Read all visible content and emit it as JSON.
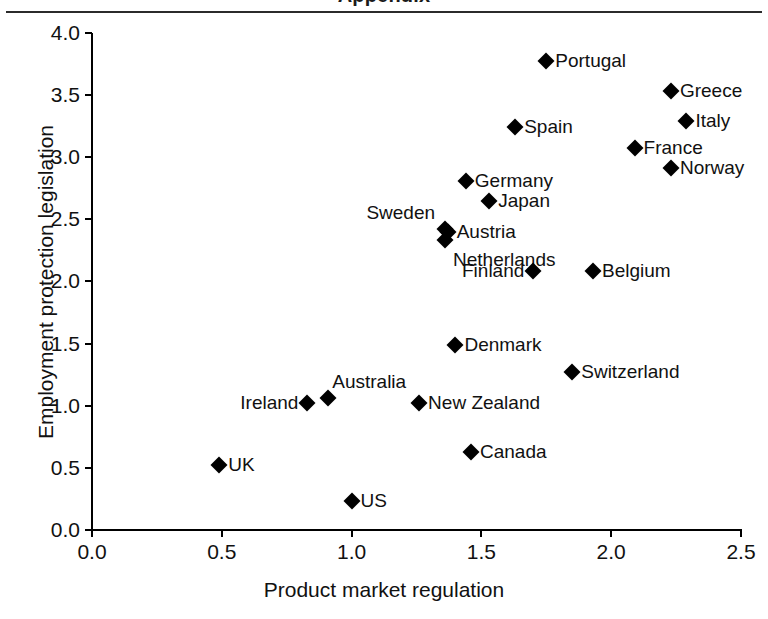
{
  "figure": {
    "title_remnant": "Appendix",
    "x_axis_title": "Product market regulation",
    "y_axis_title": "Employment protection legislation",
    "x_ticks": [
      "0.0",
      "0.5",
      "1.0",
      "1.5",
      "2.0",
      "2.5"
    ],
    "y_ticks": [
      "4.0",
      "3.5",
      "3.0",
      "2.5",
      "2.0",
      "1.5",
      "1.0",
      "0.5",
      "0.0"
    ],
    "marker_color": "#000000",
    "axis_color": "#000000"
  },
  "chart_data": {
    "type": "scatter",
    "title": "",
    "xlabel": "Product market regulation",
    "ylabel": "Employment protection legislation",
    "xlim": [
      0.0,
      2.5
    ],
    "ylim": [
      0.0,
      4.0
    ],
    "xticks": [
      0.0,
      0.5,
      1.0,
      1.5,
      2.0,
      2.5
    ],
    "yticks": [
      0.0,
      0.5,
      1.0,
      1.5,
      2.0,
      2.5,
      3.0,
      3.5,
      4.0
    ],
    "grid": false,
    "legend": "none",
    "marker": "diamond",
    "points": [
      {
        "label": "Portugal",
        "x": 1.75,
        "y": 3.77,
        "label_pos": "right"
      },
      {
        "label": "Greece",
        "x": 2.23,
        "y": 3.53,
        "label_pos": "right"
      },
      {
        "label": "Italy",
        "x": 2.29,
        "y": 3.29,
        "label_pos": "right"
      },
      {
        "label": "Spain",
        "x": 1.63,
        "y": 3.24,
        "label_pos": "right"
      },
      {
        "label": "France",
        "x": 2.09,
        "y": 3.07,
        "label_pos": "right"
      },
      {
        "label": "Norway",
        "x": 2.23,
        "y": 2.91,
        "label_pos": "right"
      },
      {
        "label": "Germany",
        "x": 1.44,
        "y": 2.81,
        "label_pos": "right"
      },
      {
        "label": "Japan",
        "x": 1.53,
        "y": 2.65,
        "label_pos": "right"
      },
      {
        "label": "Sweden",
        "x": 1.36,
        "y": 2.42,
        "label_pos": "left-above"
      },
      {
        "label": "Austria",
        "x": 1.37,
        "y": 2.4,
        "label_pos": "right"
      },
      {
        "label": "Netherlands",
        "x": 1.36,
        "y": 2.33,
        "label_pos": "right-below"
      },
      {
        "label": "Finland",
        "x": 1.7,
        "y": 2.08,
        "label_pos": "left"
      },
      {
        "label": "Belgium",
        "x": 1.93,
        "y": 2.08,
        "label_pos": "right"
      },
      {
        "label": "Denmark",
        "x": 1.4,
        "y": 1.49,
        "label_pos": "right"
      },
      {
        "label": "Switzerland",
        "x": 1.85,
        "y": 1.27,
        "label_pos": "right"
      },
      {
        "label": "Australia",
        "x": 0.91,
        "y": 1.06,
        "label_pos": "above"
      },
      {
        "label": "Ireland",
        "x": 0.83,
        "y": 1.02,
        "label_pos": "left"
      },
      {
        "label": "New Zealand",
        "x": 1.26,
        "y": 1.02,
        "label_pos": "right"
      },
      {
        "label": "Canada",
        "x": 1.46,
        "y": 0.63,
        "label_pos": "right"
      },
      {
        "label": "UK",
        "x": 0.49,
        "y": 0.52,
        "label_pos": "right"
      },
      {
        "label": "US",
        "x": 1.0,
        "y": 0.23,
        "label_pos": "right"
      }
    ]
  }
}
